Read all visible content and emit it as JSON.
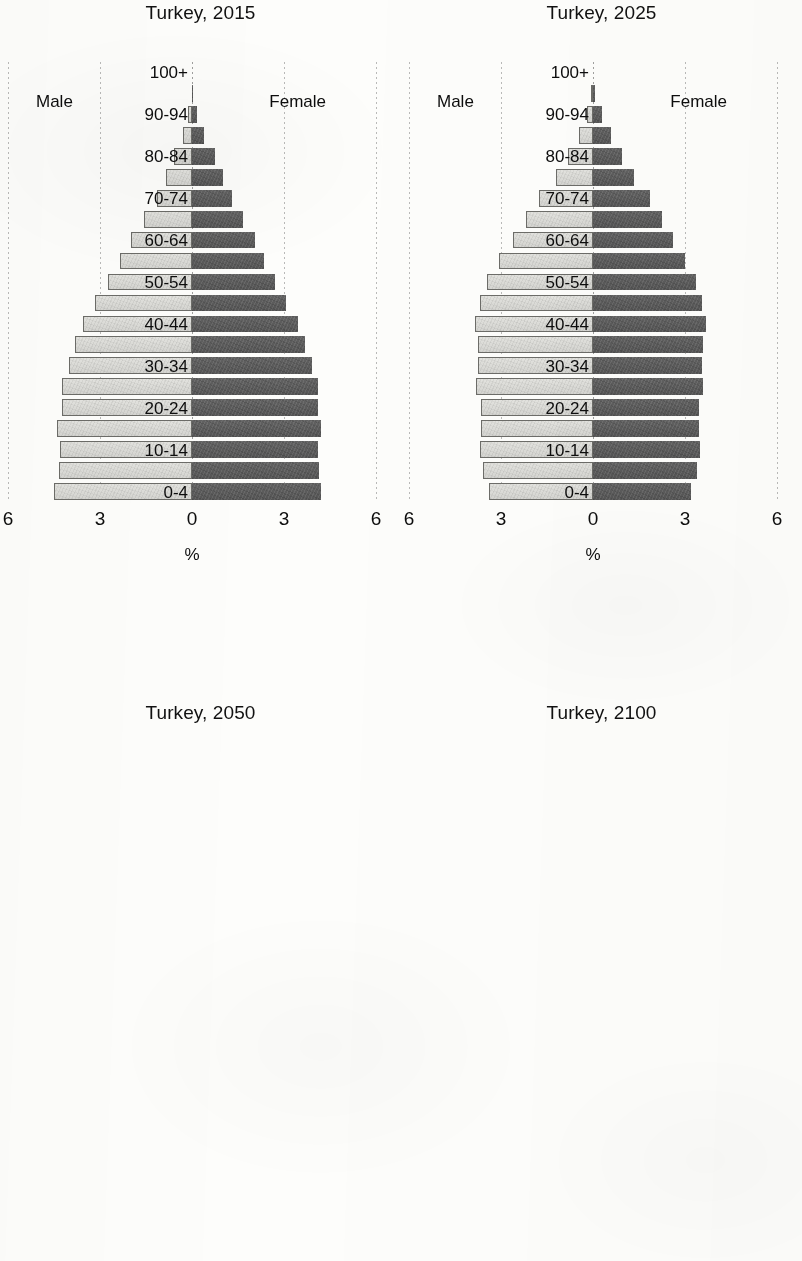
{
  "figure": {
    "subject": "Turkey",
    "axis_title": "%",
    "male_label": "Male",
    "female_label": "Female",
    "male_color": "#dcdcd8",
    "female_color": "#5b5b5b"
  },
  "age_groups": [
    "0-4",
    "5-9",
    "10-14",
    "15-19",
    "20-24",
    "25-29",
    "30-34",
    "35-39",
    "40-44",
    "45-49",
    "50-54",
    "55-59",
    "60-64",
    "65-69",
    "70-74",
    "75-79",
    "80-84",
    "85-89",
    "90-94",
    "95-99",
    "100+"
  ],
  "visible_age_labels": [
    "0-4",
    "10-14",
    "20-24",
    "30-34",
    "40-44",
    "50-54",
    "60-64",
    "70-74",
    "80-84",
    "90-94",
    "100+"
  ],
  "chart_data": [
    {
      "type": "bar",
      "subtype": "population-pyramid",
      "title": "Turkey, 2015",
      "xlabel": "%",
      "ylabel": "",
      "xlim": [
        -6,
        6
      ],
      "xticks": [
        "6",
        "3",
        "0",
        "3",
        "6"
      ],
      "xtick_values": [
        -6,
        -3,
        0,
        3,
        6
      ],
      "grid": true,
      "legend": [
        "Male",
        "Female"
      ],
      "legend_position": "inside-top-corners",
      "categories": [
        "0-4",
        "5-9",
        "10-14",
        "15-19",
        "20-24",
        "25-29",
        "30-34",
        "35-39",
        "40-44",
        "45-49",
        "50-54",
        "55-59",
        "60-64",
        "65-69",
        "70-74",
        "75-79",
        "80-84",
        "85-89",
        "90-94",
        "95-99",
        "100+"
      ],
      "series": [
        {
          "name": "Male",
          "values": [
            4.5,
            4.35,
            4.3,
            4.4,
            4.25,
            4.25,
            4.0,
            3.8,
            3.55,
            3.15,
            2.75,
            2.35,
            2.0,
            1.55,
            1.15,
            0.85,
            0.6,
            0.3,
            0.12,
            0.03,
            0.01
          ]
        },
        {
          "name": "Female",
          "values": [
            4.2,
            4.15,
            4.1,
            4.2,
            4.1,
            4.1,
            3.9,
            3.7,
            3.45,
            3.05,
            2.7,
            2.35,
            2.05,
            1.65,
            1.3,
            1.0,
            0.75,
            0.4,
            0.16,
            0.04,
            0.01
          ]
        }
      ]
    },
    {
      "type": "bar",
      "subtype": "population-pyramid",
      "title": "Turkey, 2025",
      "xlabel": "%",
      "ylabel": "",
      "xlim": [
        -6,
        6
      ],
      "xticks": [
        "6",
        "3",
        "0",
        "3",
        "6"
      ],
      "xtick_values": [
        -6,
        -3,
        0,
        3,
        6
      ],
      "grid": true,
      "legend": [
        "Male",
        "Female"
      ],
      "legend_position": "inside-top-corners",
      "categories": [
        "0-4",
        "5-9",
        "10-14",
        "15-19",
        "20-24",
        "25-29",
        "30-34",
        "35-39",
        "40-44",
        "45-49",
        "50-54",
        "55-59",
        "60-64",
        "65-69",
        "70-74",
        "75-79",
        "80-84",
        "85-89",
        "90-94",
        "95-99",
        "100+"
      ],
      "series": [
        {
          "name": "Male",
          "values": [
            3.4,
            3.6,
            3.7,
            3.65,
            3.65,
            3.8,
            3.75,
            3.75,
            3.85,
            3.7,
            3.45,
            3.05,
            2.6,
            2.2,
            1.75,
            1.2,
            0.8,
            0.45,
            0.2,
            0.05,
            0.01
          ]
        },
        {
          "name": "Female",
          "values": [
            3.2,
            3.4,
            3.5,
            3.45,
            3.45,
            3.6,
            3.55,
            3.6,
            3.7,
            3.55,
            3.35,
            3.0,
            2.6,
            2.25,
            1.85,
            1.35,
            0.95,
            0.6,
            0.28,
            0.08,
            0.02
          ]
        }
      ]
    },
    {
      "type": "bar",
      "subtype": "population-pyramid",
      "title": "Turkey, 2050",
      "xlabel": "%",
      "ylabel": "",
      "xlim": [
        -4,
        4
      ],
      "xticks": [
        "4",
        "0",
        "4"
      ],
      "xtick_values": [
        -4,
        0,
        4
      ],
      "grid": true,
      "legend": [
        "Male",
        "Female"
      ],
      "legend_position": "inside-top-corners",
      "categories": [
        "0-4",
        "5-9",
        "10-14",
        "15-19",
        "20-24",
        "25-29",
        "30-34",
        "35-39",
        "40-44",
        "45-49",
        "50-54",
        "55-59",
        "60-64",
        "65-69",
        "70-74",
        "75-79",
        "80-84",
        "85-89",
        "90-94",
        "95-99",
        "100+"
      ],
      "series": [
        {
          "name": "Male",
          "values": [
            2.55,
            2.6,
            2.7,
            2.8,
            2.95,
            3.0,
            3.1,
            3.2,
            3.3,
            3.35,
            3.35,
            3.3,
            3.15,
            2.95,
            2.6,
            2.2,
            1.7,
            1.15,
            0.6,
            0.2,
            0.04
          ]
        },
        {
          "name": "Female",
          "values": [
            2.4,
            2.45,
            2.6,
            2.65,
            2.8,
            2.85,
            2.95,
            3.05,
            3.15,
            3.2,
            3.2,
            3.2,
            3.1,
            2.95,
            2.7,
            2.4,
            1.95,
            1.45,
            0.85,
            0.35,
            0.08
          ]
        }
      ]
    },
    {
      "type": "bar",
      "subtype": "population-pyramid",
      "title": "Turkey, 2100",
      "xlabel": "%",
      "ylabel": "",
      "xlim": [
        -4,
        4
      ],
      "xticks": [
        "4",
        "0",
        "4"
      ],
      "xtick_values": [
        -4,
        0,
        4
      ],
      "grid": true,
      "legend": [
        "Male",
        "Female"
      ],
      "legend_position": "inside-top-corners",
      "categories": [
        "0-4",
        "5-9",
        "10-14",
        "15-19",
        "20-24",
        "25-29",
        "30-34",
        "35-39",
        "40-44",
        "45-49",
        "50-54",
        "55-59",
        "60-64",
        "65-69",
        "70-74",
        "75-79",
        "80-84",
        "85-89",
        "90-94",
        "95-99",
        "100+"
      ],
      "series": [
        {
          "name": "Male",
          "values": [
            2.3,
            2.35,
            2.45,
            2.5,
            2.55,
            2.6,
            2.65,
            2.7,
            2.75,
            2.8,
            2.85,
            2.85,
            2.9,
            2.9,
            2.85,
            2.75,
            2.5,
            2.05,
            1.4,
            0.7,
            0.2
          ]
        },
        {
          "name": "Female",
          "values": [
            2.2,
            2.25,
            2.35,
            2.4,
            2.45,
            2.5,
            2.55,
            2.6,
            2.65,
            2.7,
            2.75,
            2.8,
            2.85,
            2.9,
            2.9,
            2.85,
            2.7,
            2.35,
            1.75,
            1.0,
            0.35
          ]
        }
      ]
    }
  ]
}
